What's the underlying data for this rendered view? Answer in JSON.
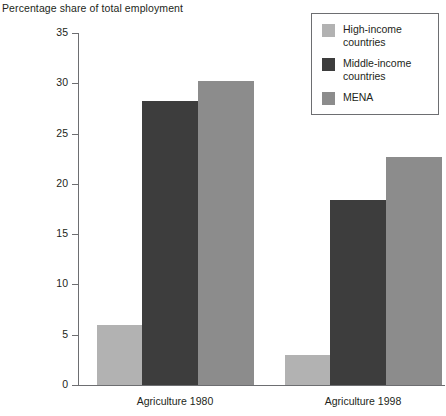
{
  "chart_data": {
    "type": "bar",
    "title": "Percentage share of total employment",
    "xlabel": "",
    "ylabel": "",
    "ylim": [
      0,
      35
    ],
    "yticks": [
      0,
      5,
      10,
      15,
      20,
      25,
      30,
      35
    ],
    "grid": false,
    "legend_position": "top-right",
    "categories": [
      "Agriculture 1980",
      "Agriculture 1998"
    ],
    "series": [
      {
        "name": "High-income countries",
        "color": "#b2b2b2",
        "values": [
          6.0,
          3.0
        ]
      },
      {
        "name": "Middle-income countries",
        "color": "#3d3d3d",
        "values": [
          28.2,
          18.4
        ]
      },
      {
        "name": "MENA",
        "color": "#8c8c8c",
        "values": [
          30.2,
          22.7
        ]
      }
    ]
  },
  "axis": {
    "tick_labels": [
      "0",
      "5",
      "10",
      "15",
      "20",
      "25",
      "30",
      "35"
    ]
  },
  "legend": {
    "entries": [
      {
        "label": "High-income countries",
        "color": "#b2b2b2"
      },
      {
        "label": "Middle-income countries",
        "color": "#3d3d3d"
      },
      {
        "label": "MENA",
        "color": "#8c8c8c"
      }
    ]
  }
}
